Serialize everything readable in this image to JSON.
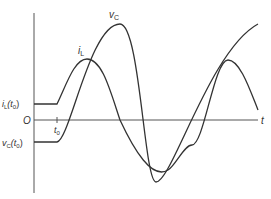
{
  "diagram": {
    "type": "waveform",
    "axes": {
      "origin_label": "O",
      "x_label": "t",
      "t0_label": "t",
      "t0_sub": "0"
    },
    "curves": {
      "iL": {
        "label_main": "i",
        "label_sub": "L",
        "initial_label_main": "i",
        "initial_label_sub": "L",
        "initial_label_arg": "(t",
        "initial_label_arg_sub": "0",
        "initial_label_close": ")"
      },
      "vC": {
        "label_main": "v",
        "label_sub": "C",
        "initial_label_main": "v",
        "initial_label_sub": "C",
        "initial_label_arg": "(t",
        "initial_label_arg_sub": "0",
        "initial_label_close": ")"
      }
    },
    "colors": {
      "curve": "#333333",
      "axis": "#555555",
      "background": "#ffffff"
    }
  }
}
